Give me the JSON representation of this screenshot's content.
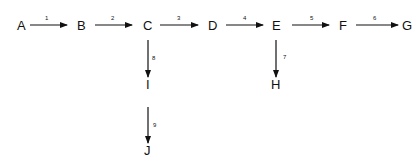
{
  "diagram": {
    "type": "flow",
    "nodes": [
      {
        "id": "A",
        "label": "A"
      },
      {
        "id": "B",
        "label": "B"
      },
      {
        "id": "C",
        "label": "C"
      },
      {
        "id": "D",
        "label": "D"
      },
      {
        "id": "E",
        "label": "E"
      },
      {
        "id": "F",
        "label": "F"
      },
      {
        "id": "G",
        "label": "G"
      },
      {
        "id": "H",
        "label": "H"
      },
      {
        "id": "I",
        "label": "I"
      },
      {
        "id": "J",
        "label": "J"
      }
    ],
    "edges": [
      {
        "from": "A",
        "to": "B",
        "label": "1"
      },
      {
        "from": "B",
        "to": "C",
        "label": "2"
      },
      {
        "from": "C",
        "to": "D",
        "label": "3"
      },
      {
        "from": "D",
        "to": "E",
        "label": "4"
      },
      {
        "from": "E",
        "to": "F",
        "label": "5"
      },
      {
        "from": "F",
        "to": "G",
        "label": "6"
      },
      {
        "from": "E",
        "to": "H",
        "label": "7"
      },
      {
        "from": "C",
        "to": "I",
        "label": "8"
      },
      {
        "from": "I",
        "to": "J",
        "label": "9"
      }
    ]
  }
}
